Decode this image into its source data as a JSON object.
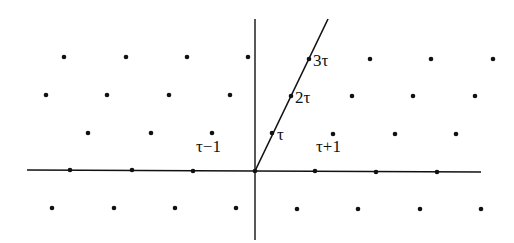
{
  "figure": {
    "colors": {
      "ink": "#111111",
      "background": "#ffffff"
    },
    "axes": {
      "horizontal": {
        "x1": 27,
        "y1": 170,
        "x2": 481,
        "y2": 172
      },
      "vertical": {
        "x1": 255,
        "y1": 19,
        "x2": 255,
        "y2": 240
      },
      "tau_ray": {
        "x1": 255,
        "y1": 171,
        "x2": 328,
        "y2": 19
      }
    },
    "lattice_points": [
      [
        64,
        57
      ],
      [
        126,
        57
      ],
      [
        187,
        57
      ],
      [
        248,
        57
      ],
      [
        309,
        59
      ],
      [
        370,
        59
      ],
      [
        431,
        59
      ],
      [
        493,
        59
      ],
      [
        46,
        95
      ],
      [
        107,
        95
      ],
      [
        169,
        95
      ],
      [
        230,
        95
      ],
      [
        291,
        96
      ],
      [
        352,
        96
      ],
      [
        413,
        96
      ],
      [
        475,
        96
      ],
      [
        88,
        133
      ],
      [
        151,
        133
      ],
      [
        212,
        133
      ],
      [
        272,
        133
      ],
      [
        333,
        134
      ],
      [
        395,
        134
      ],
      [
        456,
        134
      ],
      [
        70,
        170
      ],
      [
        132,
        170
      ],
      [
        193,
        171
      ],
      [
        255,
        171
      ],
      [
        315,
        171
      ],
      [
        376,
        172
      ],
      [
        437,
        172
      ],
      [
        52,
        208
      ],
      [
        114,
        208
      ],
      [
        175,
        208
      ],
      [
        236,
        208
      ],
      [
        297,
        209
      ],
      [
        358,
        209
      ],
      [
        420,
        209
      ],
      [
        481,
        209
      ]
    ],
    "labels": [
      {
        "id": "label-3tau",
        "text": "3τ",
        "x": 313,
        "y": 66
      },
      {
        "id": "label-2tau",
        "text": "2τ",
        "x": 295,
        "y": 103
      },
      {
        "id": "label-tau",
        "text": "τ",
        "x": 277,
        "y": 140
      },
      {
        "id": "label-tau-minus-1",
        "text": "τ−1",
        "x": 196,
        "y": 152
      },
      {
        "id": "label-tau-plus-1",
        "text": "τ+1",
        "x": 316,
        "y": 152
      }
    ]
  }
}
